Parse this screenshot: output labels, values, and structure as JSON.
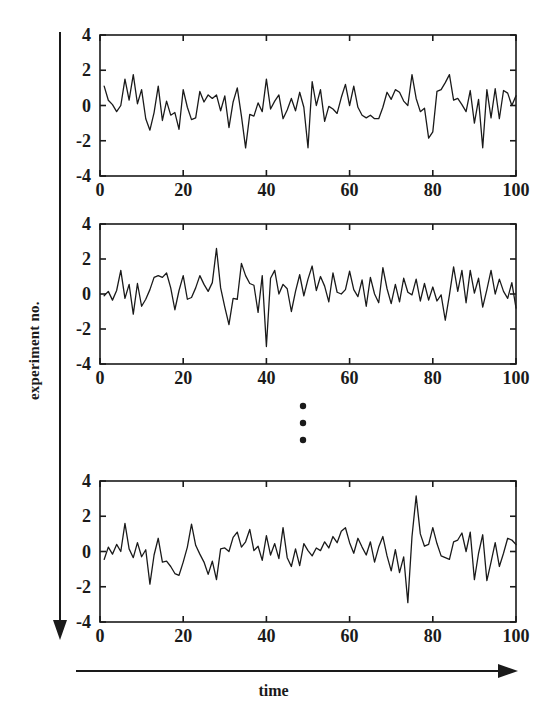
{
  "figure": {
    "vertical_axis_label": "experiment no.",
    "horizontal_axis_label": "time",
    "ellipsis_symbol": "vertical-ellipsis",
    "line_color": "#1a1a1a",
    "background_color": "#ffffff"
  },
  "chart_data": {
    "type": "line",
    "title": "",
    "xlabel": "time",
    "ylabel": "experiment no.",
    "xlim": [
      0,
      100
    ],
    "ylim": [
      -4,
      4
    ],
    "xticks": [
      0,
      20,
      40,
      60,
      80,
      100
    ],
    "yticks": [
      -4,
      -2,
      0,
      2,
      4
    ],
    "xtick_labels": [
      "0",
      "20",
      "40",
      "60",
      "80",
      "100"
    ],
    "ytick_labels": [
      "-4",
      "-2",
      "0",
      "2",
      "4"
    ],
    "grid": false,
    "legend": false,
    "panel_count": 3,
    "panels_shown_note": "three panels with a vertical ellipsis between panel 2 and panel 3 indicating omitted experiments",
    "panels": [
      {
        "name": "experiment-1",
        "x": [
          1,
          2,
          3,
          4,
          5,
          6,
          7,
          8,
          9,
          10,
          11,
          12,
          13,
          14,
          15,
          16,
          17,
          18,
          19,
          20,
          21,
          22,
          23,
          24,
          25,
          26,
          27,
          28,
          29,
          30,
          31,
          32,
          33,
          34,
          35,
          36,
          37,
          38,
          39,
          40,
          41,
          42,
          43,
          44,
          45,
          46,
          47,
          48,
          49,
          50,
          51,
          52,
          53,
          54,
          55,
          56,
          57,
          58,
          59,
          60,
          61,
          62,
          63,
          64,
          65,
          66,
          67,
          68,
          69,
          70,
          71,
          72,
          73,
          74,
          75,
          76,
          77,
          78,
          79,
          80,
          81,
          82,
          83,
          84,
          85,
          86,
          87,
          88,
          89,
          90,
          91,
          92,
          93,
          94,
          95,
          96,
          97,
          98,
          99,
          100
        ],
        "values": [
          1.1,
          0.3,
          0.05,
          -0.35,
          0.0,
          1.5,
          0.3,
          1.75,
          0.1,
          0.9,
          -0.75,
          -1.4,
          -0.4,
          1.1,
          -0.85,
          0.25,
          -0.55,
          -0.4,
          -1.35,
          0.9,
          -0.1,
          -0.8,
          -0.7,
          0.8,
          0.2,
          0.6,
          0.4,
          0.6,
          -0.3,
          0.55,
          -1.25,
          0.2,
          1.0,
          -0.6,
          -2.4,
          -0.5,
          -0.6,
          0.15,
          -0.35,
          1.5,
          -0.2,
          0.25,
          0.6,
          -0.75,
          -0.25,
          0.4,
          -0.3,
          0.75,
          -0.1,
          -2.4,
          1.35,
          0.0,
          0.9,
          -0.9,
          -0.05,
          -0.2,
          -0.45,
          0.45,
          1.2,
          0.0,
          1.1,
          -0.1,
          -0.55,
          -0.7,
          -0.55,
          -0.75,
          -0.75,
          -0.1,
          0.75,
          0.35,
          0.9,
          0.75,
          0.25,
          0.0,
          1.75,
          0.4,
          -0.35,
          -0.15,
          -1.85,
          -1.5,
          0.8,
          0.9,
          1.3,
          1.75,
          0.3,
          0.4,
          0.05,
          -0.35,
          0.85,
          -1.0,
          0.35,
          -2.4,
          0.9,
          -0.7,
          0.95,
          -0.75,
          0.85,
          0.7,
          0.0,
          0.55
        ]
      },
      {
        "name": "experiment-2",
        "x": [
          1,
          2,
          3,
          4,
          5,
          6,
          7,
          8,
          9,
          10,
          11,
          12,
          13,
          14,
          15,
          16,
          17,
          18,
          19,
          20,
          21,
          22,
          23,
          24,
          25,
          26,
          27,
          28,
          29,
          30,
          31,
          32,
          33,
          34,
          35,
          36,
          37,
          38,
          39,
          40,
          41,
          42,
          43,
          44,
          45,
          46,
          47,
          48,
          49,
          50,
          51,
          52,
          53,
          54,
          55,
          56,
          57,
          58,
          59,
          60,
          61,
          62,
          63,
          64,
          65,
          66,
          67,
          68,
          69,
          70,
          71,
          72,
          73,
          74,
          75,
          76,
          77,
          78,
          79,
          80,
          81,
          82,
          83,
          84,
          85,
          86,
          87,
          88,
          89,
          90,
          91,
          92,
          93,
          94,
          95,
          96,
          97,
          98,
          99,
          100
        ],
        "values": [
          -0.1,
          0.15,
          -0.35,
          0.2,
          1.35,
          -0.25,
          0.55,
          -1.15,
          0.6,
          -0.7,
          -0.3,
          0.25,
          0.95,
          1.05,
          0.95,
          1.2,
          0.35,
          -0.9,
          0.2,
          1.05,
          -0.3,
          -0.2,
          0.35,
          1.05,
          0.55,
          0.15,
          0.65,
          2.6,
          0.35,
          -0.75,
          -1.75,
          -0.25,
          -0.3,
          1.75,
          1.05,
          0.6,
          0.5,
          -1.05,
          1.05,
          -3.0,
          0.9,
          1.35,
          0.0,
          0.55,
          0.3,
          -1.0,
          0.15,
          1.1,
          -0.1,
          0.85,
          1.6,
          0.2,
          1.0,
          0.45,
          -0.45,
          1.2,
          0.1,
          0.0,
          0.25,
          1.3,
          0.25,
          -0.15,
          0.8,
          -0.7,
          0.95,
          0.0,
          -0.5,
          1.5,
          0.3,
          -0.55,
          0.55,
          -0.45,
          0.9,
          0.1,
          -0.05,
          0.85,
          -0.4,
          0.6,
          -0.35,
          0.4,
          -0.4,
          -0.05,
          -1.5,
          -0.05,
          1.55,
          0.15,
          1.35,
          -0.5,
          1.35,
          0.05,
          0.9,
          -0.75,
          0.25,
          1.35,
          0.0,
          0.85,
          0.15,
          -0.25,
          0.65,
          -0.8
        ]
      },
      {
        "name": "experiment-n",
        "x": [
          1,
          2,
          3,
          4,
          5,
          6,
          7,
          8,
          9,
          10,
          11,
          12,
          13,
          14,
          15,
          16,
          17,
          18,
          19,
          20,
          21,
          22,
          23,
          24,
          25,
          26,
          27,
          28,
          29,
          30,
          31,
          32,
          33,
          34,
          35,
          36,
          37,
          38,
          39,
          40,
          41,
          42,
          43,
          44,
          45,
          46,
          47,
          48,
          49,
          50,
          51,
          52,
          53,
          54,
          55,
          56,
          57,
          58,
          59,
          60,
          61,
          62,
          63,
          64,
          65,
          66,
          67,
          68,
          69,
          70,
          71,
          72,
          73,
          74,
          75,
          76,
          77,
          78,
          79,
          80,
          81,
          82,
          83,
          84,
          85,
          86,
          87,
          88,
          89,
          90,
          91,
          92,
          93,
          94,
          95,
          96,
          97,
          98,
          99,
          100
        ],
        "values": [
          -0.45,
          0.25,
          -0.15,
          0.4,
          0.0,
          1.6,
          0.15,
          -0.35,
          0.5,
          -0.3,
          0.1,
          -1.85,
          -0.2,
          0.75,
          -0.6,
          -0.55,
          -0.85,
          -1.25,
          -1.35,
          -0.6,
          0.25,
          1.55,
          0.35,
          -0.15,
          -0.6,
          -1.3,
          -0.55,
          -1.6,
          0.15,
          0.2,
          0.0,
          0.8,
          1.1,
          0.25,
          0.55,
          1.25,
          0.05,
          0.3,
          -0.5,
          0.9,
          -0.2,
          0.45,
          -0.4,
          1.35,
          -0.35,
          -0.85,
          0.15,
          -0.8,
          0.45,
          0.05,
          -0.25,
          0.2,
          0.05,
          0.55,
          0.2,
          0.85,
          0.5,
          1.15,
          1.35,
          0.5,
          -0.1,
          0.75,
          0.25,
          -0.2,
          0.55,
          -0.6,
          0.25,
          0.85,
          -0.25,
          -1.1,
          0.1,
          -1.2,
          -0.3,
          -2.9,
          0.85,
          3.15,
          1.0,
          0.3,
          0.4,
          1.35,
          0.45,
          -0.25,
          -0.35,
          -0.45,
          0.55,
          0.65,
          1.05,
          0.0,
          1.1,
          -1.6,
          -0.1,
          0.95,
          -1.65,
          -0.6,
          0.5,
          -0.85,
          -0.1,
          0.75,
          0.65,
          0.4
        ]
      }
    ]
  }
}
